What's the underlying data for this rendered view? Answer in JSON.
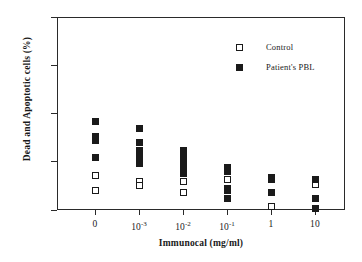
{
  "chart_data": {
    "type": "scatter",
    "title": "",
    "xlabel": "Immunocal (mg/ml)",
    "ylabel": "Dead and Apoptotic cells (%)",
    "categories": [
      "0",
      "10 -3",
      "10 -2",
      "10 -1",
      "1",
      "10"
    ],
    "category_labels_html": [
      "0",
      "10<sup>-3</sup>",
      "10<sup>-2</sup>",
      "10<sup>-1</sup>",
      "1",
      "10"
    ],
    "ylim": [
      0,
      100
    ],
    "yticks": [
      0,
      25,
      50,
      75,
      100
    ],
    "ytick_labels": [
      "0",
      "25",
      "50",
      "75",
      "100"
    ],
    "grid": false,
    "legend_position": "top-right",
    "series": [
      {
        "name": "Control",
        "marker": "open-square",
        "color": "#ffffff",
        "edge_color": "#1a1a1a",
        "points": [
          {
            "category": "0",
            "value": 18
          },
          {
            "category": "0",
            "value": 10
          },
          {
            "category": "10 -3",
            "value": 15
          },
          {
            "category": "10 -3",
            "value": 12.5
          },
          {
            "category": "10 -2",
            "value": 15
          },
          {
            "category": "10 -2",
            "value": 9
          },
          {
            "category": "10 -1",
            "value": 16
          },
          {
            "category": "1",
            "value": 9
          },
          {
            "category": "1",
            "value": 2
          },
          {
            "category": "10",
            "value": 13
          }
        ]
      },
      {
        "name": "Patient's PBL",
        "marker": "filled-square",
        "color": "#1a1a1a",
        "edge_color": "#1a1a1a",
        "points": [
          {
            "category": "0",
            "value": 46
          },
          {
            "category": "0",
            "value": 38
          },
          {
            "category": "0",
            "value": 36
          },
          {
            "category": "0",
            "value": 27
          },
          {
            "category": "10 -3",
            "value": 42
          },
          {
            "category": "10 -3",
            "value": 35
          },
          {
            "category": "10 -3",
            "value": 31
          },
          {
            "category": "10 -3",
            "value": 27
          },
          {
            "category": "10 -3",
            "value": 25
          },
          {
            "category": "10 -3",
            "value": 24
          },
          {
            "category": "10 -2",
            "value": 31
          },
          {
            "category": "10 -2",
            "value": 29
          },
          {
            "category": "10 -2",
            "value": 27
          },
          {
            "category": "10 -2",
            "value": 25
          },
          {
            "category": "10 -2",
            "value": 23
          },
          {
            "category": "10 -2",
            "value": 21
          },
          {
            "category": "10 -2",
            "value": 19
          },
          {
            "category": "10 -1",
            "value": 22
          },
          {
            "category": "10 -1",
            "value": 20
          },
          {
            "category": "10 -1",
            "value": 11
          },
          {
            "category": "10 -1",
            "value": 10
          },
          {
            "category": "10 -1",
            "value": 6
          },
          {
            "category": "1",
            "value": 17
          },
          {
            "category": "1",
            "value": 16
          },
          {
            "category": "1",
            "value": 9
          },
          {
            "category": "10",
            "value": 16
          },
          {
            "category": "10",
            "value": 6
          },
          {
            "category": "10",
            "value": 1
          }
        ]
      }
    ]
  },
  "legend": {
    "items": [
      {
        "label": "Control",
        "marker": "open-square"
      },
      {
        "label": "Patient's PBL",
        "marker": "filled-square"
      }
    ]
  }
}
